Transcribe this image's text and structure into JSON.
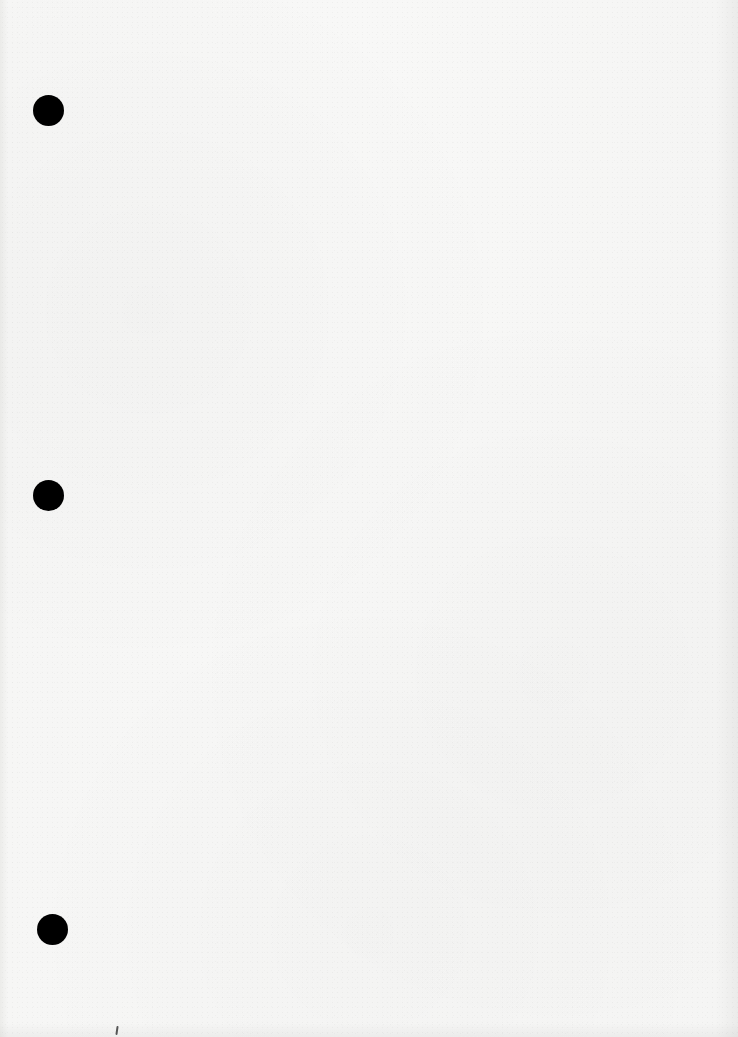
{
  "document": {
    "type": "blank-three-hole-punched-sheet",
    "text": "",
    "paper_color": "#f7f7f6",
    "punch_hole_color": "#000000",
    "punch_holes": [
      {
        "name": "top",
        "cx": 48,
        "cy": 110
      },
      {
        "name": "middle",
        "cx": 48,
        "cy": 495
      },
      {
        "name": "bottom",
        "cx": 52,
        "cy": 929
      }
    ],
    "marks": [
      {
        "name": "bottom-speck",
        "x": 117,
        "y": 1030
      }
    ]
  }
}
